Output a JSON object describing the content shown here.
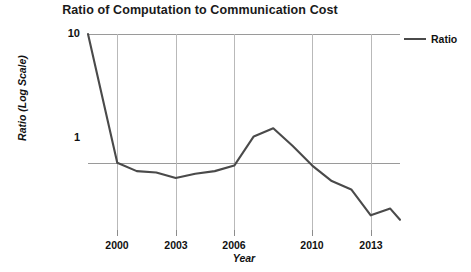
{
  "chart_data": {
    "type": "line",
    "title": "Ratio of Computation to Communication Cost",
    "xlabel": "Year",
    "ylabel": "Ratio (Log Scale)",
    "yscale": "log",
    "ylim": [
      0.3,
      10
    ],
    "xlim": [
      1998.5,
      2014.5
    ],
    "grid": true,
    "legend_position": "right",
    "y_ticks": [
      {
        "value": 10,
        "label": "10"
      },
      {
        "value": 1,
        "label": "1"
      }
    ],
    "x_ticks": [
      {
        "value": 2000,
        "label": "2000"
      },
      {
        "value": 2003,
        "label": "2003"
      },
      {
        "value": 2006,
        "label": "2006"
      },
      {
        "value": 2010,
        "label": "2010"
      },
      {
        "value": 2013,
        "label": "2013"
      }
    ],
    "gridline_years": [
      2000,
      2003,
      2006,
      2010,
      2013
    ],
    "series": [
      {
        "name": "Ratio",
        "color": "#4a4a4a",
        "x": [
          1998.5,
          2000,
          2001,
          2002,
          2003,
          2004,
          2005,
          2006,
          2007,
          2008,
          2009,
          2010,
          2011,
          2012,
          2013,
          2014,
          2014.5
        ],
        "values": [
          10.0,
          1.0,
          0.86,
          0.84,
          0.76,
          0.82,
          0.86,
          0.95,
          1.6,
          1.85,
          1.35,
          0.95,
          0.72,
          0.62,
          0.39,
          0.44,
          0.36
        ]
      }
    ]
  },
  "legend": {
    "label": "Ratio"
  }
}
